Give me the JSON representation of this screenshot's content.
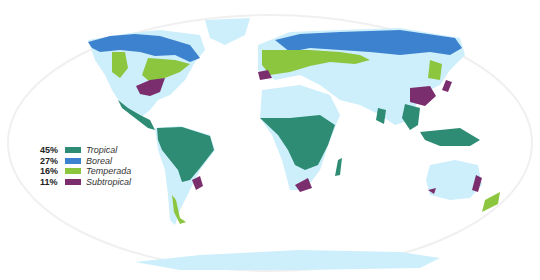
{
  "map": {
    "projection": "world-robinson-style",
    "colors": {
      "ocean_outline": "#f2f2f2",
      "land_nonforest": "#cdeefb",
      "tropical": "#2e8b74",
      "boreal": "#3d82cf",
      "temperate": "#8cc63f",
      "subtropical": "#7b2e6e"
    }
  },
  "legend": {
    "items": [
      {
        "pct": "45%",
        "label": "Tropical",
        "color": "#2e8b74"
      },
      {
        "pct": "27%",
        "label": "Boreal",
        "color": "#3d82cf"
      },
      {
        "pct": "16%",
        "label": "Temperada",
        "color": "#8cc63f"
      },
      {
        "pct": "11%",
        "label": "Subtropical",
        "color": "#7b2e6e"
      }
    ]
  }
}
